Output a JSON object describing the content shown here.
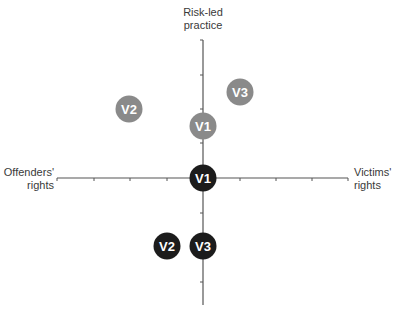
{
  "axes": {
    "top_label_line1": "Risk-led",
    "top_label_line2": "practice",
    "left_label_line1": "Offenders'",
    "left_label_line2": "rights",
    "right_label_line1": "Victims'",
    "right_label_line2": "rights"
  },
  "colors": {
    "axis": "#555555",
    "gray_circle": "#8a8a8a",
    "black_circle": "#1c1c1c",
    "circle_text": "#ffffff"
  },
  "points": {
    "gray": [
      {
        "label": "V2",
        "x": -2,
        "y": 2
      },
      {
        "label": "V3",
        "x": 1,
        "y": 2.5
      },
      {
        "label": "V1",
        "x": 0,
        "y": 1.5
      }
    ],
    "black": [
      {
        "label": "V1",
        "x": 0,
        "y": 0
      },
      {
        "label": "V2",
        "x": -1,
        "y": -2
      },
      {
        "label": "V3",
        "x": 0,
        "y": -2
      }
    ]
  }
}
